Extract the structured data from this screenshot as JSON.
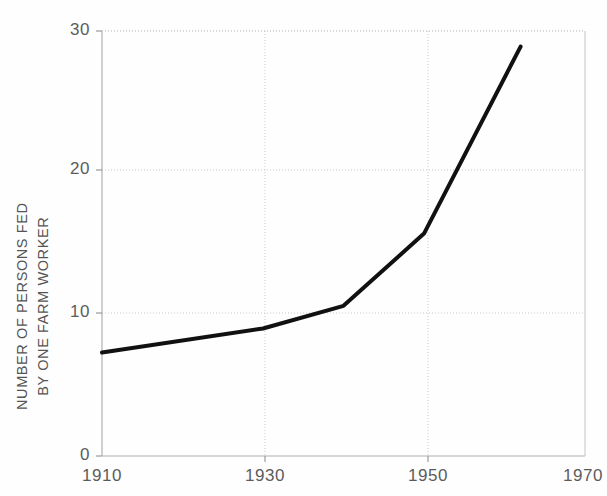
{
  "chart_data": {
    "type": "line",
    "title": "",
    "subtitle": "",
    "xlabel": "",
    "ylabel": "NUMBER OF PERSONS FED BY ONE FARM WORKER",
    "ylabel_line1": "NUMBER OF PERSONS FED",
    "ylabel_line2": "BY ONE FARM WORKER",
    "xlim": [
      1910,
      1970
    ],
    "ylim": [
      0,
      30
    ],
    "xticks": [
      1910,
      1930,
      1950,
      1970
    ],
    "xtick_labels": [
      "1910",
      "1930",
      "1950",
      "1970"
    ],
    "yticks": [
      0,
      10,
      20,
      30
    ],
    "ytick_labels": [
      "0",
      "10",
      "20",
      "30"
    ],
    "grid": true,
    "grid_style": "dotted",
    "legend": null,
    "series": [
      {
        "name": "Persons fed by one farm worker",
        "color": "#111111",
        "line_width": 4,
        "x": [
          1910,
          1930,
          1940,
          1950,
          1962
        ],
        "values": [
          7.3,
          9.0,
          10.6,
          15.7,
          28.9
        ]
      }
    ]
  },
  "style": {
    "axis_color": "#b8b8b8",
    "grid_color": "#c9c9c9",
    "line_color": "#111111",
    "text_color": "#5c5c5c",
    "background": "#fefefe"
  },
  "geometry": {
    "plot_left": 102,
    "plot_right": 585,
    "plot_top": 31,
    "plot_bottom": 456
  }
}
